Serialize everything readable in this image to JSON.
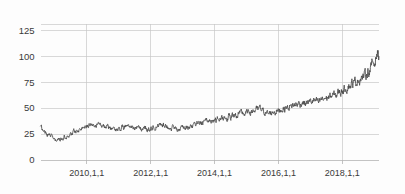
{
  "chart_data": {
    "type": "line",
    "title": "",
    "subtitle": "",
    "xlabel": "",
    "ylabel": "",
    "grid": true,
    "legend": false,
    "legend_position": "none",
    "line_color": "#4a4a4a",
    "grid_color": "#c8c8c8",
    "background_color": "#fdfdfd",
    "xlim": [
      2008.55,
      2019.15
    ],
    "ylim": [
      0,
      131
    ],
    "y_ticks": [
      0,
      25,
      50,
      75,
      100,
      125
    ],
    "y_tick_labels": [
      "0",
      "25",
      "50",
      "75",
      "100",
      "125"
    ],
    "x_ticks": [
      2010,
      2012,
      2014,
      2016,
      2018
    ],
    "x_tick_labels": [
      "2010,1,1",
      "2012,1,1",
      "2014,1,1",
      "2016,1,1",
      "2018,1,1"
    ],
    "series": [
      {
        "name": "price",
        "x": [
          2008.55,
          2008.6,
          2008.65,
          2008.7,
          2008.75,
          2008.8,
          2008.85,
          2008.9,
          2008.95,
          2009.0,
          2009.05,
          2009.1,
          2009.15,
          2009.2,
          2009.25,
          2009.3,
          2009.35,
          2009.4,
          2009.45,
          2009.5,
          2009.55,
          2009.6,
          2009.65,
          2009.7,
          2009.75,
          2009.8,
          2009.85,
          2009.9,
          2009.95,
          2010.0,
          2010.05,
          2010.1,
          2010.15,
          2010.2,
          2010.25,
          2010.3,
          2010.35,
          2010.4,
          2010.45,
          2010.5,
          2010.55,
          2010.6,
          2010.65,
          2010.7,
          2010.75,
          2010.8,
          2010.85,
          2010.9,
          2010.95,
          2011.0,
          2011.05,
          2011.1,
          2011.15,
          2011.2,
          2011.25,
          2011.3,
          2011.35,
          2011.4,
          2011.45,
          2011.5,
          2011.55,
          2011.6,
          2011.65,
          2011.7,
          2011.75,
          2011.8,
          2011.85,
          2011.9,
          2011.95,
          2012.0,
          2012.05,
          2012.1,
          2012.15,
          2012.2,
          2012.25,
          2012.3,
          2012.35,
          2012.4,
          2012.45,
          2012.5,
          2012.55,
          2012.6,
          2012.65,
          2012.7,
          2012.75,
          2012.8,
          2012.85,
          2012.9,
          2012.95,
          2013.0,
          2013.05,
          2013.1,
          2013.15,
          2013.2,
          2013.25,
          2013.3,
          2013.35,
          2013.4,
          2013.45,
          2013.5,
          2013.55,
          2013.6,
          2013.65,
          2013.7,
          2013.75,
          2013.8,
          2013.85,
          2013.9,
          2013.95,
          2014.0,
          2014.05,
          2014.1,
          2014.15,
          2014.2,
          2014.25,
          2014.3,
          2014.35,
          2014.4,
          2014.45,
          2014.5,
          2014.55,
          2014.6,
          2014.65,
          2014.7,
          2014.75,
          2014.8,
          2014.85,
          2014.9,
          2014.95,
          2015.0,
          2015.05,
          2015.1,
          2015.15,
          2015.2,
          2015.25,
          2015.3,
          2015.35,
          2015.4,
          2015.45,
          2015.5,
          2015.55,
          2015.6,
          2015.65,
          2015.7,
          2015.75,
          2015.8,
          2015.85,
          2015.9,
          2015.95,
          2016.0,
          2016.05,
          2016.1,
          2016.15,
          2016.2,
          2016.25,
          2016.3,
          2016.35,
          2016.4,
          2016.45,
          2016.5,
          2016.55,
          2016.6,
          2016.65,
          2016.7,
          2016.75,
          2016.8,
          2016.85,
          2016.9,
          2016.95,
          2017.0,
          2017.05,
          2017.1,
          2017.15,
          2017.2,
          2017.25,
          2017.3,
          2017.35,
          2017.4,
          2017.45,
          2017.5,
          2017.55,
          2017.6,
          2017.65,
          2017.7,
          2017.75,
          2017.8,
          2017.85,
          2017.9,
          2017.95,
          2018.0,
          2018.05,
          2018.1,
          2018.15,
          2018.2,
          2018.25,
          2018.3,
          2018.35,
          2018.4,
          2018.45,
          2018.5,
          2018.55,
          2018.6,
          2018.65,
          2018.7,
          2018.75,
          2018.8,
          2018.85,
          2018.9,
          2018.95,
          2019.0,
          2019.05,
          2019.1,
          2019.15
        ],
        "y": [
          32,
          30,
          27,
          28,
          25,
          24,
          26,
          23,
          21,
          19,
          18,
          20,
          19,
          22,
          20,
          23,
          21,
          24,
          23,
          26,
          25,
          28,
          27,
          30,
          29,
          31,
          30,
          33,
          32,
          34,
          33,
          35,
          34,
          36,
          35,
          34,
          36,
          35,
          33,
          34,
          33,
          32,
          33,
          31,
          30,
          31,
          29,
          30,
          29,
          31,
          30,
          32,
          31,
          33,
          32,
          31,
          33,
          32,
          30,
          31,
          30,
          32,
          31,
          30,
          29,
          31,
          30,
          29,
          30,
          31,
          30,
          32,
          31,
          33,
          32,
          34,
          33,
          35,
          34,
          33,
          32,
          31,
          30,
          32,
          31,
          30,
          29,
          31,
          30,
          32,
          31,
          30,
          32,
          31,
          33,
          32,
          34,
          33,
          35,
          34,
          36,
          35,
          37,
          36,
          38,
          37,
          39,
          38,
          37,
          39,
          38,
          40,
          39,
          41,
          40,
          42,
          41,
          40,
          42,
          41,
          43,
          42,
          44,
          43,
          45,
          44,
          46,
          45,
          44,
          46,
          45,
          47,
          46,
          48,
          47,
          49,
          48,
          50,
          49,
          48,
          47,
          46,
          45,
          44,
          46,
          45,
          47,
          46,
          48,
          47,
          49,
          48,
          50,
          49,
          51,
          50,
          52,
          51,
          53,
          52,
          54,
          53,
          55,
          54,
          56,
          55,
          54,
          56,
          55,
          57,
          56,
          58,
          57,
          56,
          55,
          57,
          59,
          58,
          60,
          59,
          61,
          60,
          62,
          61,
          63,
          62,
          64,
          66,
          65,
          68,
          67,
          70,
          69,
          72,
          71,
          74,
          73,
          76,
          75,
          78,
          77,
          80,
          79,
          83,
          82,
          86,
          85,
          89,
          95,
          92,
          99,
          103,
          100
        ]
      }
    ],
    "series_extra_points": {
      "note": "dense noisy daily series; rendered with deterministic jitter overlay",
      "end_peak_value": 122,
      "end_final_value": 116,
      "start_value": 32,
      "min_value": 18,
      "max_value": 122
    }
  },
  "axes": {
    "y_axis_name": "value-axis",
    "x_axis_name": "date-axis"
  }
}
